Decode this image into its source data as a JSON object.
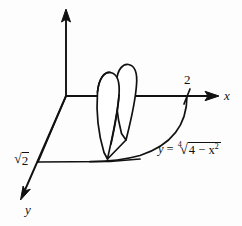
{
  "figure": {
    "background_color": "#fdfdfd",
    "line_color": "#111111",
    "axes": [
      {
        "id": "x",
        "label": "x",
        "direction": "right",
        "has_arrow": true
      },
      {
        "id": "y",
        "label": "y",
        "direction": "down-left",
        "has_arrow": true
      },
      {
        "id": "z",
        "label": "",
        "direction": "up",
        "has_arrow": true
      }
    ],
    "tick_labels": [
      {
        "axis": "x",
        "text": "2",
        "value": 2
      },
      {
        "axis": "y",
        "text": "√2",
        "value": 1.41421,
        "parts": {
          "sign": "√",
          "radicand": "2"
        }
      }
    ],
    "curve_label": {
      "lhs": "y",
      "equals": "=",
      "index": "4",
      "radical_sign": "√",
      "radicand_base": "4 − x",
      "radicand_exponent": "2",
      "plain_text": "y = ⁴√(4 − x²)"
    },
    "elements": [
      {
        "name": "base-region",
        "description": "planar region in the xy-plane bounded by the x-axis, the y-axis and the curve y = fourth root of 4 minus x squared"
      },
      {
        "name": "cross-section-slab",
        "description": "a thin vertical slab of the solid standing on the base region, with two rounded petal-shaped faces"
      }
    ]
  }
}
